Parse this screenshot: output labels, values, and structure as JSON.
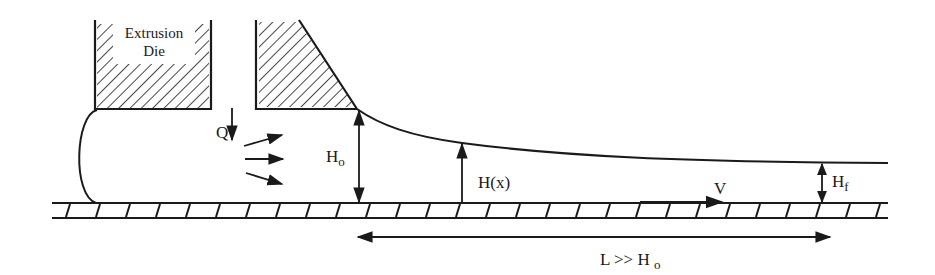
{
  "diagram": {
    "type": "extrusion onto moving belt schematic",
    "colors": {
      "ink": "#1a1a1a",
      "background": "#ffffff"
    },
    "die": {
      "label_line1": "Extrusion",
      "label_line2": "Die"
    },
    "labels": {
      "flow_rate": "Q",
      "initial_height_main": "H",
      "initial_height_sub": "o",
      "local_height": "H(x)",
      "belt_velocity": "V",
      "final_height_main": "H",
      "final_height_sub": "f",
      "length_relation_main": "L >> H",
      "length_relation_sub": "o"
    }
  }
}
